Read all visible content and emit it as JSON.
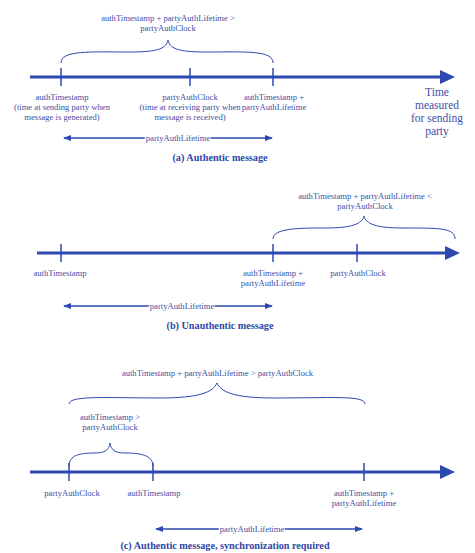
{
  "panel_a": {
    "condition": "authTimestamp + partyAuthLifetime >",
    "condition2": "partyAuthClock",
    "tick1_line1": "authTimestamp",
    "tick1_line2": "(time at sending party when",
    "tick1_line3": "message is generated)",
    "tick2_line1": "partyAuthClock",
    "tick2_line2": "(time at receiving party when",
    "tick2_line3": "message is received)",
    "tick3_line1": "authTimestamp +",
    "tick3_line2": "partyAuthLifetime",
    "axis_label_1": "Time",
    "axis_label_2": "measured",
    "axis_label_3": "for sending",
    "axis_label_4": "party",
    "span_label": "partyAuthLifetime",
    "caption": "(a) Authentic message"
  },
  "panel_b": {
    "condition": "authTimestamp + partyAuthLifetime <",
    "condition2": "partyAuthClock",
    "tick1": "authTimestamp",
    "tick2_line1": "authTimestamp +",
    "tick2_line2": "partyAuthLifetime",
    "tick3": "partyAuthClock",
    "span_label": "partyAuthLifetime",
    "caption": "(b) Unauthentic message"
  },
  "panel_c": {
    "condition_outer": "authTimestamp + partyAuthLifetime > partyAuthClock",
    "condition_inner_1": "authTimestamp  >",
    "condition_inner_2": "partyAuthClock",
    "tick1": "partyAuthClock",
    "tick2": "authTimestamp",
    "tick3_line1": "authTimestamp +",
    "tick3_line2": "partyAuthLifetime",
    "span_label": "partyAuthLifetime",
    "caption": "(c) Authentic message, synchronization required"
  },
  "colors": {
    "line": "#2d49b0",
    "text": "#3a4fa8"
  }
}
